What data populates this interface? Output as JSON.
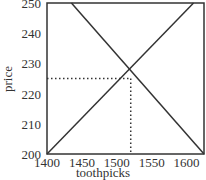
{
  "chart_data": {
    "type": "line",
    "title": "",
    "xlabel": "toothpicks",
    "ylabel": "price",
    "xlim": [
      1400,
      1625
    ],
    "ylim": [
      200,
      250
    ],
    "xticks": [
      "1400",
      "1450",
      "1500",
      "1550",
      "1600"
    ],
    "yticks": [
      "200",
      "210",
      "220",
      "230",
      "240",
      "250"
    ],
    "grid": false,
    "series": [
      {
        "name": "supply",
        "x": [
          1400,
          1610
        ],
        "y": [
          200,
          250
        ]
      },
      {
        "name": "demand",
        "x": [
          1435,
          1625
        ],
        "y": [
          250,
          200
        ]
      }
    ],
    "annotations": [
      {
        "type": "dotted-guide",
        "x": 1520,
        "y": 225,
        "label": "equilibrium"
      }
    ]
  }
}
